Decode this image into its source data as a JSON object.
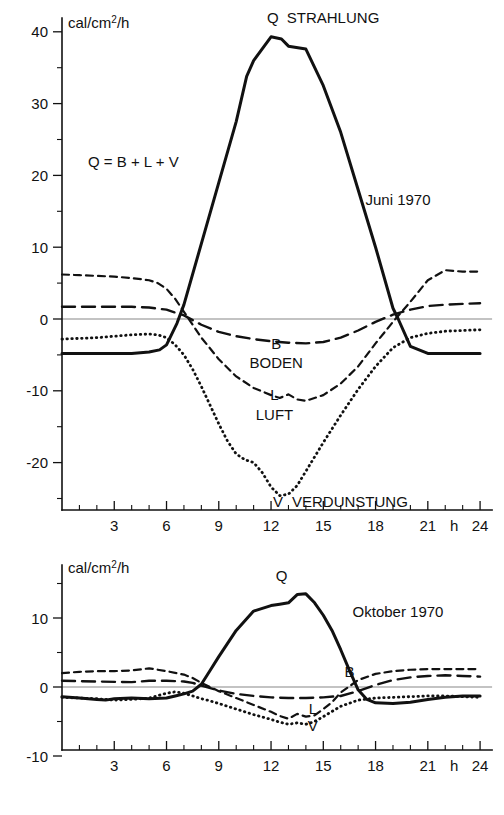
{
  "figure": {
    "background": "#ffffff",
    "ink_color": "#111111",
    "zero_line_color": "#888888"
  },
  "chart_data": [
    {
      "type": "line",
      "id": "june-1970",
      "title": "Juni 1970",
      "annotation": "Q = B + L + V",
      "ylabel": "cal/cm²/h",
      "xlabel": "h",
      "xlim": [
        0,
        24
      ],
      "ylim": [
        -27,
        42
      ],
      "xticks": [
        3,
        6,
        9,
        12,
        15,
        18,
        21,
        24
      ],
      "xtick_labels": [
        "3",
        "6",
        "9",
        "12",
        "15",
        "18",
        "21",
        "24"
      ],
      "x_axis_unit_label": "h",
      "minor_xtick_interval": 1,
      "yticks": [
        -20,
        -10,
        0,
        10,
        20,
        30,
        40
      ],
      "ytick_labels": [
        "-20",
        "-10",
        "0",
        "10",
        "20",
        "30",
        "40"
      ],
      "minor_yticks": [
        -25,
        -15,
        -5,
        5,
        15,
        25,
        35
      ],
      "grid": false,
      "legend": "inline-labels",
      "series": [
        {
          "name": "Q",
          "label": "STRAHLUNG",
          "style": "solid",
          "label_x": 12.1,
          "label_y": 41.2,
          "x": [
            0,
            1,
            2,
            3,
            4,
            5,
            5.6,
            6,
            6.6,
            7,
            8,
            9,
            10,
            10.6,
            11,
            12,
            12.6,
            13,
            14,
            15,
            16,
            17,
            18,
            19,
            19.3,
            20,
            21,
            22,
            23,
            24
          ],
          "y": [
            -4.8,
            -4.8,
            -4.8,
            -4.8,
            -4.8,
            -4.6,
            -4.3,
            -3.6,
            -0.6,
            2.0,
            10.5,
            19.0,
            27.5,
            33.8,
            36.0,
            39.3,
            39.0,
            38.0,
            37.6,
            32.5,
            26.0,
            18.0,
            10.0,
            1.5,
            0.0,
            -3.8,
            -4.8,
            -4.8,
            -4.8,
            -4.8
          ]
        },
        {
          "name": "B",
          "label": "BODEN",
          "style": "long-dash",
          "label_x": 12.3,
          "label_y": -6.8,
          "label_letter_y": -4.2,
          "x": [
            0,
            2,
            4,
            5,
            6,
            7,
            8,
            9,
            10,
            11,
            12,
            13,
            14,
            15,
            16,
            17,
            18,
            19,
            20,
            21,
            22,
            23,
            24
          ],
          "y": [
            1.7,
            1.7,
            1.7,
            1.6,
            1.3,
            0.5,
            -0.8,
            -1.8,
            -2.4,
            -2.8,
            -3.1,
            -3.3,
            -3.4,
            -3.2,
            -2.6,
            -1.6,
            -0.4,
            0.6,
            1.3,
            1.8,
            2.0,
            2.1,
            2.2
          ]
        },
        {
          "name": "L",
          "label": "LUFT",
          "style": "short-dash",
          "label_x": 12.2,
          "label_y": -14.0,
          "label_letter_y": -11.3,
          "x": [
            0,
            1,
            2,
            3,
            4,
            5,
            5.5,
            6,
            6.5,
            7,
            7.5,
            8,
            9,
            10,
            11,
            12,
            12.5,
            13,
            13.5,
            14,
            15,
            16,
            17,
            18,
            19,
            20,
            21,
            22,
            23,
            24
          ],
          "y": [
            6.2,
            6.1,
            6.0,
            5.9,
            5.7,
            5.4,
            5.0,
            4.2,
            2.8,
            1.0,
            -0.8,
            -2.6,
            -5.6,
            -8.0,
            -9.6,
            -10.6,
            -11.0,
            -10.5,
            -11.2,
            -11.4,
            -10.6,
            -9.0,
            -6.6,
            -3.4,
            -0.4,
            2.4,
            5.4,
            6.8,
            6.6,
            6.6
          ]
        },
        {
          "name": "V",
          "label": "VERDUNSTUNG",
          "style": "dotted",
          "label_x": 12.4,
          "label_y": -26.2,
          "x": [
            0,
            1,
            2,
            3,
            4,
            5,
            5.5,
            6,
            6.5,
            7,
            7.5,
            8,
            8.5,
            9,
            9.5,
            10,
            10.5,
            11,
            11.5,
            12,
            12.5,
            13,
            13.5,
            14,
            15,
            16,
            17,
            18,
            19,
            20,
            21,
            22,
            23,
            24
          ],
          "y": [
            -2.8,
            -2.7,
            -2.6,
            -2.4,
            -2.2,
            -2.1,
            -2.2,
            -2.6,
            -3.6,
            -5.0,
            -7.0,
            -9.4,
            -12.0,
            -14.6,
            -17.0,
            -18.8,
            -19.6,
            -20.0,
            -21.4,
            -23.4,
            -24.6,
            -24.4,
            -23.2,
            -21.2,
            -17.2,
            -13.4,
            -9.8,
            -6.6,
            -4.0,
            -2.6,
            -2.0,
            -1.7,
            -1.6,
            -1.5
          ]
        }
      ]
    },
    {
      "type": "line",
      "id": "october-1970",
      "title": "Oktober 1970",
      "ylabel": "cal/cm²/h",
      "xlabel": "h",
      "xlim": [
        0,
        24
      ],
      "ylim": [
        -12,
        17
      ],
      "xticks": [
        3,
        6,
        9,
        12,
        15,
        18,
        21,
        24
      ],
      "xtick_labels": [
        "3",
        "6",
        "9",
        "12",
        "15",
        "18",
        "21",
        "24"
      ],
      "x_axis_unit_label": "h",
      "minor_xtick_interval": 1,
      "yticks": [
        -10,
        0,
        10
      ],
      "ytick_labels": [
        "-10",
        "0",
        "10"
      ],
      "minor_yticks": [
        -5,
        5,
        15
      ],
      "grid": false,
      "legend": "inline-labels",
      "series": [
        {
          "name": "Q",
          "label": "",
          "style": "solid",
          "label_x": 12.6,
          "label_y": 15.3,
          "x": [
            0,
            1,
            2,
            2.5,
            3,
            4,
            5,
            6,
            6.5,
            7,
            7.5,
            8,
            8.5,
            9,
            10,
            11,
            12,
            12.5,
            13,
            13.5,
            14,
            14.5,
            15,
            15.5,
            16,
            16.5,
            17,
            17.5,
            18,
            19,
            20,
            21,
            22,
            23,
            24
          ],
          "y": [
            -1.4,
            -1.6,
            -1.8,
            -1.9,
            -1.7,
            -1.6,
            -1.7,
            -1.6,
            -1.3,
            -1.0,
            -0.6,
            0.4,
            2.4,
            4.4,
            8.2,
            11.0,
            11.8,
            12.0,
            12.2,
            13.4,
            13.5,
            12.2,
            10.4,
            8.2,
            5.4,
            2.4,
            -0.4,
            -1.8,
            -2.3,
            -2.4,
            -2.2,
            -1.8,
            -1.5,
            -1.3,
            -1.3
          ]
        },
        {
          "name": "B",
          "label": "",
          "style": "long-dash",
          "label_x": 16.5,
          "label_y": 1.4,
          "x": [
            0,
            2,
            4,
            5,
            6,
            7,
            7.5,
            8,
            9,
            10,
            11,
            12,
            13,
            14,
            15,
            16,
            17,
            18,
            19,
            20,
            21,
            22,
            23,
            24
          ],
          "y": [
            0.9,
            0.8,
            0.7,
            0.9,
            0.9,
            0.8,
            0.6,
            0.2,
            -0.5,
            -1.0,
            -1.3,
            -1.5,
            -1.6,
            -1.6,
            -1.5,
            -1.3,
            -0.6,
            0.3,
            1.0,
            1.4,
            1.6,
            1.7,
            1.6,
            1.5
          ]
        },
        {
          "name": "L",
          "label": "",
          "style": "short-dash",
          "label_x": 14.4,
          "label_y": -3.9,
          "x": [
            0,
            1,
            2,
            3,
            4,
            5,
            6,
            7,
            7.5,
            8,
            9,
            10,
            11,
            12,
            12.5,
            13,
            13.5,
            14,
            14.5,
            15,
            15.5,
            16,
            17,
            18,
            19,
            20,
            21,
            22,
            23,
            24
          ],
          "y": [
            2.0,
            2.2,
            2.3,
            2.3,
            2.4,
            2.7,
            2.3,
            1.8,
            1.3,
            0.6,
            -0.6,
            -1.6,
            -2.6,
            -3.6,
            -4.2,
            -4.6,
            -3.9,
            -4.3,
            -4.1,
            -3.2,
            -2.2,
            -0.8,
            1.0,
            1.9,
            2.3,
            2.5,
            2.6,
            2.6,
            2.6,
            2.6
          ]
        },
        {
          "name": "V",
          "label": "",
          "style": "dotted",
          "label_x": 14.4,
          "label_y": -6.4,
          "x": [
            0,
            1,
            2,
            3,
            4,
            5,
            6,
            6.5,
            7,
            7.5,
            8,
            8.5,
            9,
            10,
            11,
            12,
            12.5,
            13,
            13.5,
            14,
            14.5,
            15,
            16,
            17,
            18,
            19,
            20,
            21,
            22,
            23,
            24
          ],
          "y": [
            -1.5,
            -1.6,
            -1.7,
            -1.9,
            -1.8,
            -1.6,
            -0.9,
            -0.7,
            -0.9,
            -1.3,
            -1.7,
            -2.0,
            -2.4,
            -3.2,
            -4.0,
            -4.7,
            -5.1,
            -5.4,
            -5.2,
            -5.4,
            -5.0,
            -4.3,
            -2.8,
            -1.9,
            -1.6,
            -1.5,
            -1.4,
            -1.3,
            -1.3,
            -1.4,
            -1.5
          ]
        }
      ]
    }
  ]
}
